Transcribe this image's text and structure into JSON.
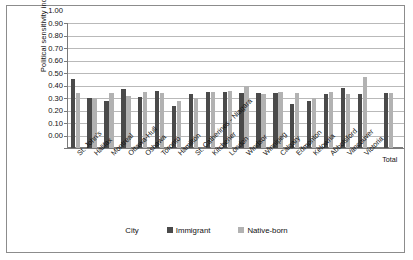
{
  "chart_data": {
    "type": "bar",
    "title": "",
    "xlabel": "City",
    "ylabel": "Political sensitivity index",
    "ylim": [
      0.0,
      1.0
    ],
    "ytick_labels": [
      "1.00",
      "0.90",
      "0.80",
      "0.70",
      "0.60",
      "0.50",
      "0.40",
      "0.30",
      "0.20",
      "0.10",
      "0.00"
    ],
    "grid": true,
    "legend_position": "bottom",
    "categories": [
      "St. John's",
      "Halifax",
      "Montreal",
      "Ottawa-Hull",
      "Oshawa",
      "Toronto",
      "Hamilton",
      "St. Catherines - Niagara",
      "Kitchener",
      "London",
      "Windsor",
      "Winnipeg",
      "Calgary",
      "Edmonton",
      "Kelowna",
      "Abbotsford",
      "Vancouver",
      "Victoria",
      "Total"
    ],
    "series": [
      {
        "name": "Immigrant",
        "color": "#4a4a4a",
        "values": [
          0.55,
          0.4,
          0.38,
          0.47,
          0.41,
          0.46,
          0.34,
          0.43,
          0.45,
          0.45,
          0.44,
          0.44,
          0.44,
          0.35,
          0.38,
          0.43,
          0.48,
          0.43,
          0.44
        ]
      },
      {
        "name": "Native-born",
        "color": "#b2b2b2",
        "values": [
          0.44,
          0.4,
          0.44,
          0.42,
          0.45,
          0.44,
          0.38,
          0.4,
          0.45,
          0.46,
          0.5,
          0.43,
          0.45,
          0.44,
          0.4,
          0.45,
          0.43,
          0.57,
          0.44
        ]
      }
    ]
  },
  "axes": {
    "y_title": "Political sensitivity index",
    "x_title": "City"
  },
  "legend": {
    "items": [
      {
        "label": "Immigrant",
        "color": "#4a4a4a"
      },
      {
        "label": "Native-born",
        "color": "#b2b2b2"
      }
    ]
  }
}
